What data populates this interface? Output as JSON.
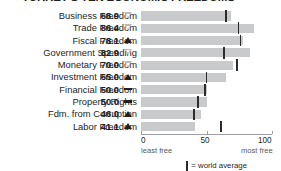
{
  "chart_data": {
    "type": "bar",
    "title": "TURKEY'S TEN ECONOMIC FREEDOMS",
    "xlabel": "",
    "ylabel": "",
    "xlim": [
      0,
      100
    ],
    "grid": false,
    "orientation": "horizontal",
    "categories": [
      "Business Freedom",
      "Trade Freedom",
      "Fiscal Freedom",
      "Government Spending",
      "Monetary Freedom",
      "Investment Freedom",
      "Financial Freedom",
      "Property Rights",
      "Fdm. from Corruption",
      "Labor Freedom"
    ],
    "values": [
      68.9,
      86.4,
      78.1,
      82.9,
      70.0,
      65.0,
      50.0,
      50.0,
      46.0,
      41.1
    ],
    "value_labels": [
      "68.9",
      "86.4",
      "78.1",
      "82.9",
      "70.0",
      "65.0",
      "50.0",
      "50.0",
      "46.0",
      "41.1"
    ],
    "trends": [
      "down",
      "down",
      "up",
      "down",
      "down",
      "up",
      "flat",
      "flat",
      "up",
      "up"
    ],
    "world_average": [
      65.0,
      74.5,
      76.0,
      63.5,
      73.0,
      50.0,
      49.0,
      43.5,
      40.5,
      61.0
    ],
    "axis_ticks": [
      {
        "value": 0,
        "label": "0",
        "sublabel": "least free"
      },
      {
        "value": 50,
        "label": "50",
        "sublabel": ""
      },
      {
        "value": 100,
        "label": "100",
        "sublabel": "most free"
      }
    ],
    "legend": {
      "position": "bottom-center",
      "entries": [
        {
          "marker": "world-average-tick",
          "label": "= world average"
        }
      ]
    },
    "colors": {
      "bar": "#c9cacc",
      "tick": "#2b2b2b",
      "text": "#231f20",
      "axis": "#9d9fa2",
      "trend_down": "#b9babc",
      "trend_up": "#231f20"
    }
  },
  "legend": {
    "world_average_label": "= world average"
  }
}
